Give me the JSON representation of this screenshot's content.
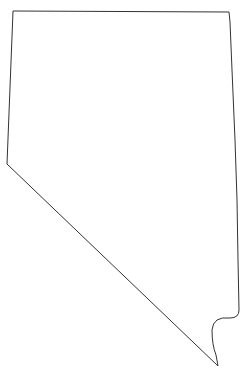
{
  "map": {
    "region": "Nevada state outline",
    "stroke_color": "#333333",
    "fill_color": "#ffffff",
    "background": "#ffffff"
  }
}
